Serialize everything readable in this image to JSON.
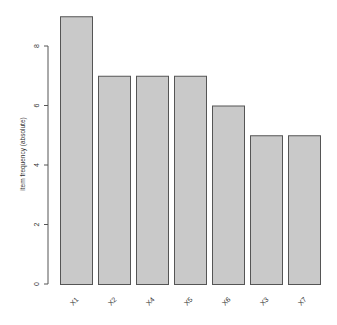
{
  "chart_data": {
    "type": "bar",
    "title": "",
    "xlabel": "",
    "ylabel": "item frequency (absolute)",
    "categories": [
      "X1",
      "X2",
      "X4",
      "X5",
      "X6",
      "X3",
      "X7"
    ],
    "values": [
      9,
      7,
      7,
      7,
      6,
      5,
      5
    ],
    "ylim": [
      0,
      9
    ],
    "yticks": [
      0,
      2,
      4,
      6,
      8
    ],
    "grid": false,
    "legend": null,
    "colors": {
      "bar_fill": "#c9c9c9",
      "bar_border": "#555555",
      "axis": "#555555",
      "text": "#333333"
    }
  }
}
